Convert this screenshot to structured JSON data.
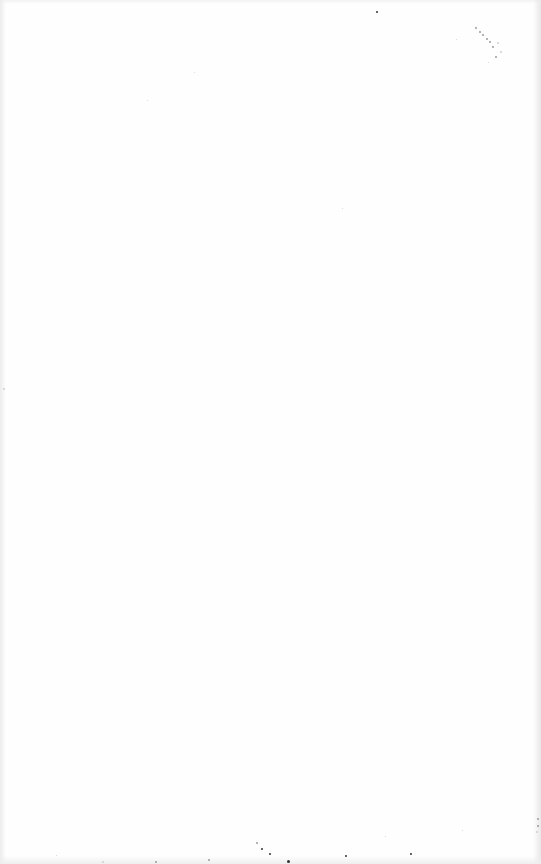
{
  "page": {
    "type": "blank-scanned-page",
    "text": "",
    "background_color": "#fefefe",
    "specks": [
      {
        "x": 376,
        "y": 11,
        "size": 2,
        "tone": "dark"
      },
      {
        "x": 475,
        "y": 27,
        "size": 2,
        "tone": "light"
      },
      {
        "x": 479,
        "y": 31,
        "size": 2,
        "tone": "light"
      },
      {
        "x": 482,
        "y": 34,
        "size": 2,
        "tone": "light"
      },
      {
        "x": 486,
        "y": 38,
        "size": 2,
        "tone": "light"
      },
      {
        "x": 489,
        "y": 41,
        "size": 2,
        "tone": "light"
      },
      {
        "x": 492,
        "y": 46,
        "size": 2,
        "tone": "light"
      },
      {
        "x": 497,
        "y": 42,
        "size": 2,
        "tone": "faint"
      },
      {
        "x": 500,
        "y": 51,
        "size": 2,
        "tone": "faint"
      },
      {
        "x": 495,
        "y": 56,
        "size": 2,
        "tone": "light"
      },
      {
        "x": 488,
        "y": 62,
        "size": 1,
        "tone": "faint"
      },
      {
        "x": 456,
        "y": 39,
        "size": 1,
        "tone": "faint"
      },
      {
        "x": 194,
        "y": 72,
        "size": 1,
        "tone": "faint"
      },
      {
        "x": 147,
        "y": 100,
        "size": 1,
        "tone": "faint"
      },
      {
        "x": 342,
        "y": 208,
        "size": 1,
        "tone": "faint"
      },
      {
        "x": 3,
        "y": 388,
        "size": 2,
        "tone": "faint"
      },
      {
        "x": 256,
        "y": 842,
        "size": 2,
        "tone": "light"
      },
      {
        "x": 261,
        "y": 848,
        "size": 2,
        "tone": "dark"
      },
      {
        "x": 269,
        "y": 853,
        "size": 2,
        "tone": "dark"
      },
      {
        "x": 287,
        "y": 860,
        "size": 3,
        "tone": "dark"
      },
      {
        "x": 345,
        "y": 855,
        "size": 2,
        "tone": "dark"
      },
      {
        "x": 410,
        "y": 853,
        "size": 2,
        "tone": "dark"
      },
      {
        "x": 208,
        "y": 859,
        "size": 2,
        "tone": "light"
      },
      {
        "x": 155,
        "y": 861,
        "size": 2,
        "tone": "light"
      },
      {
        "x": 102,
        "y": 861,
        "size": 2,
        "tone": "faint"
      },
      {
        "x": 56,
        "y": 855,
        "size": 1,
        "tone": "faint"
      },
      {
        "x": 537,
        "y": 818,
        "size": 2,
        "tone": "light"
      },
      {
        "x": 537,
        "y": 825,
        "size": 2,
        "tone": "light"
      },
      {
        "x": 536,
        "y": 831,
        "size": 2,
        "tone": "faint"
      },
      {
        "x": 462,
        "y": 830,
        "size": 1,
        "tone": "faint"
      },
      {
        "x": 385,
        "y": 836,
        "size": 1,
        "tone": "faint"
      }
    ]
  }
}
